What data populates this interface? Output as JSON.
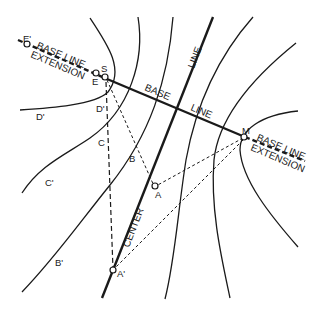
{
  "diagram": {
    "title": "",
    "labels": {
      "base_line_extension_left_top": "BASE LINE",
      "base_line_extension_left_bottom": "EXTENSION",
      "base_1": "BASE",
      "base_2": "LINE",
      "base_line_extension_right_top": "BASE LINE",
      "base_line_extension_right_bottom": "EXTENSION",
      "center": "CENTER",
      "center_line": "LINE"
    },
    "points": {
      "e_prime": "E'",
      "e": "E",
      "s": "S",
      "m": "M",
      "a": "A",
      "a_prime": "A'",
      "b": "B",
      "b_prime": "B'",
      "c": "C",
      "c_prime": "C'",
      "d": "D'",
      "d_prime": "D'"
    },
    "colors": {
      "ink": "#1a1a1a",
      "background": "#ffffff"
    }
  }
}
